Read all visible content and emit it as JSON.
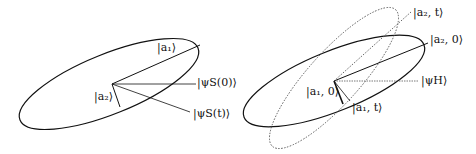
{
  "left_panel": {
    "labels": {
      "a1": "|a₁⟩",
      "a2": "|a₂⟩",
      "psi0": "|ψS(0)⟩",
      "psit": "|ψS(t)⟩"
    }
  },
  "right_panel": {
    "labels": {
      "a2t": "|a₂, t⟩",
      "a20": "|a₂, 0⟩",
      "psiH": "|ψH⟩",
      "a10": "|a₁, 0⟩",
      "a1t": "|a₁, t⟩"
    }
  }
}
